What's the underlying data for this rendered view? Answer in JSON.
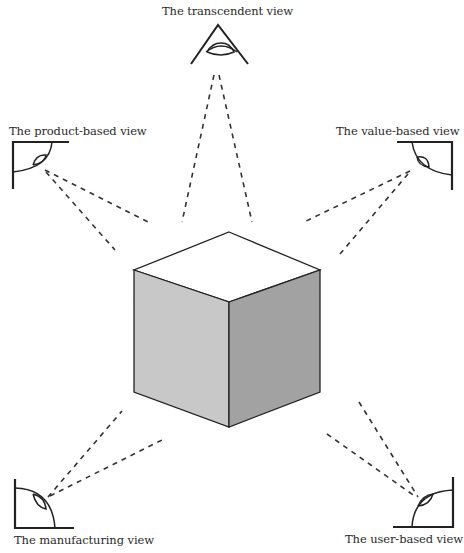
{
  "diagram": {
    "center_object": "cube",
    "views": [
      {
        "id": "transcendent",
        "label": "The transcendent view"
      },
      {
        "id": "product",
        "label": "The product-based view"
      },
      {
        "id": "value",
        "label": "The value-based view"
      },
      {
        "id": "manufacturing",
        "label": "The manufacturing view"
      },
      {
        "id": "user",
        "label": "The user-based view"
      }
    ],
    "colors": {
      "stroke": "#222222",
      "cube_top": "#ffffff",
      "cube_left": "#c9c9c9",
      "cube_right": "#a3a3a3",
      "dash": "#333333"
    }
  }
}
